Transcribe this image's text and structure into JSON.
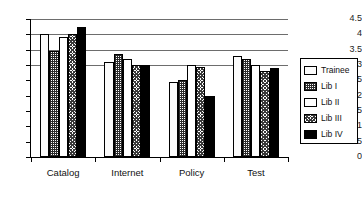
{
  "chart_data": {
    "type": "bar",
    "title": "",
    "xlabel": "",
    "ylabel": "",
    "ylim": [
      0,
      4.5
    ],
    "grid": true,
    "legend_position": "right",
    "categories": [
      "Catalog",
      "Internet",
      "Policy",
      "Test"
    ],
    "ytick_labels": [
      "0",
      "0.5",
      "1",
      "1.5",
      "2",
      "2.5",
      "3",
      "3.5",
      "4",
      "4.5"
    ],
    "ytick_values": [
      0,
      0.5,
      1,
      1.5,
      2,
      2.5,
      3,
      3.5,
      4,
      4.5
    ],
    "gridline_values": [
      3,
      3.5,
      4,
      4.5
    ],
    "series": [
      {
        "name": "Trainee",
        "pattern": "white-outline",
        "values": [
          4.0,
          3.1,
          2.45,
          3.3
        ]
      },
      {
        "name": "Lib I",
        "pattern": "fine-dot-grid",
        "values": [
          3.45,
          3.35,
          2.5,
          3.2
        ]
      },
      {
        "name": "Lib II",
        "pattern": "white",
        "values": [
          3.9,
          3.2,
          3.0,
          3.0
        ]
      },
      {
        "name": "Lib III",
        "pattern": "dark-checker",
        "values": [
          4.0,
          3.0,
          2.95,
          2.8
        ]
      },
      {
        "name": "Lib IV",
        "pattern": "solid-black",
        "values": [
          4.25,
          3.0,
          2.0,
          2.9
        ]
      }
    ]
  },
  "legend": {
    "items": [
      {
        "label": "Trainee"
      },
      {
        "label": "Lib I"
      },
      {
        "label": "Lib II"
      },
      {
        "label": "Lib III"
      },
      {
        "label": "Lib IV"
      }
    ]
  }
}
